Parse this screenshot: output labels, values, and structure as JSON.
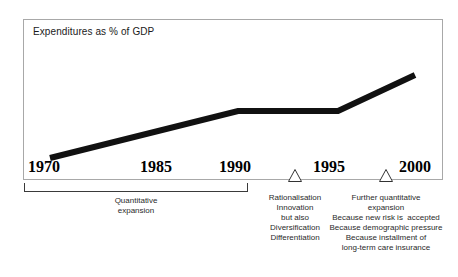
{
  "chart_data": {
    "type": "line",
    "title": "Expenditures as % of GDP",
    "xlabel": "",
    "ylabel": "",
    "grid": false,
    "legend": null,
    "x": [
      1970,
      1985,
      1990,
      1995,
      2000
    ],
    "tick_labels": [
      "1970",
      "1985",
      "1990",
      "1995",
      "2000"
    ],
    "series": [
      {
        "name": "Expenditures as % of GDP",
        "values": [
          10,
          38,
          52,
          52,
          75
        ]
      }
    ],
    "annotations": [
      {
        "at": "1970-1990",
        "label": "Quantitative expansion",
        "lines": [
          "Quantitative",
          "expansion"
        ]
      },
      {
        "at": "1991-1992",
        "label": "Rationalisation",
        "lines": [
          "Rationalisation",
          "Innovation",
          "but also",
          "Diversification",
          "Differentiation"
        ]
      },
      {
        "at": "1998",
        "label": "Further quantitative expansion",
        "lines": [
          "Further quantitative",
          "expansion",
          "Because new risk is  accepted",
          "Because demographic pressure",
          "Because installment of",
          "long-term care insurance"
        ]
      }
    ]
  },
  "chart": {
    "title": "Expenditures as % of GDP",
    "years": [
      {
        "label": "1970",
        "left": 28
      },
      {
        "label": "1985",
        "left": 140
      },
      {
        "label": "1990",
        "left": 219
      },
      {
        "label": "1995",
        "left": 313
      },
      {
        "label": "2000",
        "left": 399
      }
    ],
    "line_color": "#111111",
    "frame_color": "#a8a8a8"
  },
  "bracket": {
    "lines": "Quantitative\nexpansion"
  },
  "callout_rationalisation": {
    "lines": "Rationalisation\nInnovation\nbut also\nDiversification\nDifferentiation"
  },
  "callout_expansion": {
    "lines": "Further quantitative\nexpansion\nBecause new risk is  accepted\nBecause demographic pressure\nBecause installment of\nlong-term care insurance"
  }
}
